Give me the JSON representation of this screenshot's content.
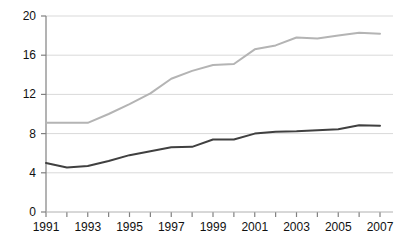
{
  "chart_data": {
    "type": "line",
    "title": "",
    "subtitle": "",
    "xlabel": "",
    "ylabel": "",
    "x": [
      1991,
      1992,
      1993,
      1994,
      1995,
      1996,
      1997,
      1998,
      1999,
      2000,
      2001,
      2002,
      2003,
      2004,
      2005,
      2006,
      2007
    ],
    "xlim": [
      1991,
      2007
    ],
    "ylim": [
      0,
      20
    ],
    "y_ticks": [
      0,
      4,
      8,
      12,
      16,
      20
    ],
    "y_tick_labels": [
      "0",
      "4",
      "8",
      "12",
      "16",
      "20"
    ],
    "x_ticks": [
      1991,
      1992,
      1993,
      1994,
      1995,
      1996,
      1997,
      1998,
      1999,
      2000,
      2001,
      2002,
      2003,
      2004,
      2005,
      2006,
      2007
    ],
    "x_tick_labels": [
      "1991",
      "",
      "1993",
      "",
      "1995",
      "",
      "1997",
      "",
      "1999",
      "",
      "2001",
      "",
      "2003",
      "",
      "2005",
      "",
      "2007"
    ],
    "x_labels_shown": [
      "1991",
      "1993",
      "1995",
      "1997",
      "1999",
      "2001",
      "2003",
      "2005",
      "2007"
    ],
    "grid": true,
    "grid_axis": "y",
    "legend": false,
    "legend_position": "none",
    "series": [
      {
        "name": "upper-series",
        "color": "#b4b4b4",
        "line_width": 2,
        "values": [
          9.1,
          9.1,
          9.1,
          10.0,
          11.0,
          12.1,
          13.6,
          14.4,
          15.0,
          15.1,
          16.6,
          17.0,
          17.8,
          17.7,
          18.0,
          18.3,
          18.2
        ]
      },
      {
        "name": "lower-series",
        "color": "#404040",
        "line_width": 2,
        "values": [
          5.0,
          4.55,
          4.7,
          5.2,
          5.8,
          6.2,
          6.6,
          6.65,
          7.4,
          7.4,
          8.0,
          8.2,
          8.25,
          8.35,
          8.45,
          8.85,
          8.8
        ]
      }
    ],
    "colors": {
      "grid": "#d9d9d9",
      "axis": "#808080",
      "tick_text": "#111111",
      "background": "#ffffff"
    }
  }
}
